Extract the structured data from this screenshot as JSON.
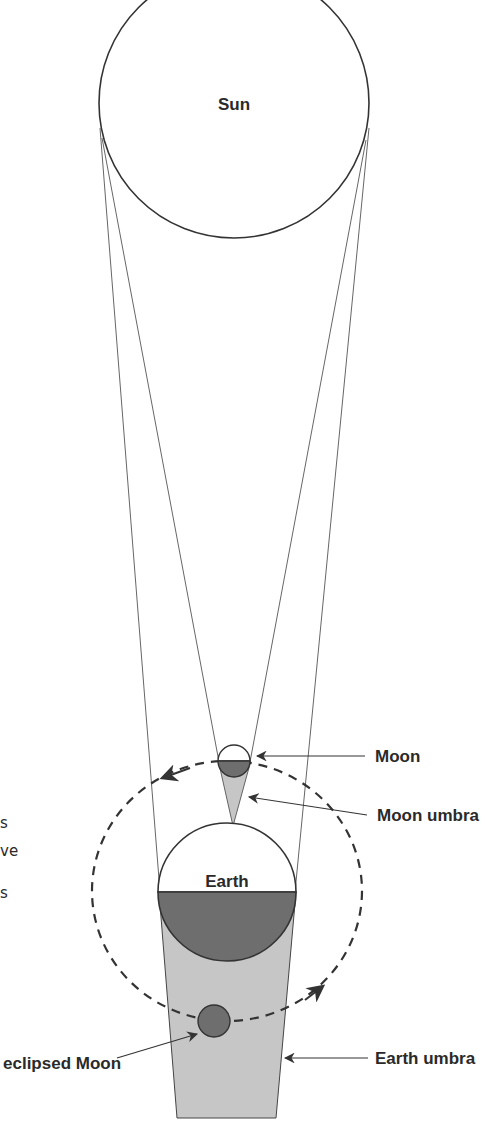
{
  "diagram": {
    "bodies": {
      "sun": {
        "label": "Sun"
      },
      "earth": {
        "label": "Earth"
      },
      "moon": {
        "label": "Moon"
      },
      "eclipsed_moon": {
        "label": "eclipsed Moon"
      }
    },
    "callouts": {
      "moon": "Moon",
      "moon_umbra": "Moon umbra",
      "earth_umbra": "Earth umbra",
      "eclipsed_moon": "eclipsed Moon"
    },
    "colors": {
      "line": "#333333",
      "shadow_dark": "#6e6e6e",
      "umbra_light": "#c6c6c6",
      "background": "#ffffff"
    }
  },
  "edge_text_fragments": [
    "s",
    "ve",
    "s"
  ]
}
